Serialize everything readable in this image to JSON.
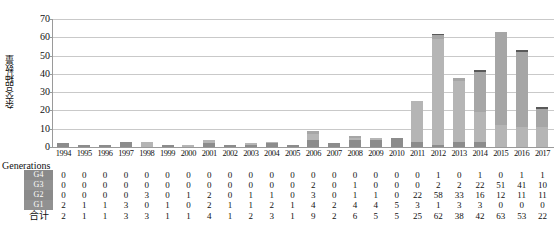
{
  "chart_data": {
    "type": "bar",
    "stacked": true,
    "title": "",
    "xlabel": "",
    "ylabel": "杂交品种数量",
    "ylim": [
      0,
      70
    ],
    "yticks": [
      0,
      10,
      20,
      30,
      40,
      50,
      60,
      70
    ],
    "grid": true,
    "legend_position": "table-below",
    "categories": [
      "1994",
      "1995",
      "1996",
      "1997",
      "1998",
      "1999",
      "2000",
      "2001",
      "2002",
      "2003",
      "2004",
      "2005",
      "2006",
      "2007",
      "2008",
      "2009",
      "2010",
      "2011",
      "2012",
      "2013",
      "2014",
      "2015",
      "2016",
      "2017"
    ],
    "series": [
      {
        "name": "G4",
        "color": "#595959",
        "values": [
          0,
          0,
          0,
          0,
          0,
          0,
          0,
          0,
          0,
          0,
          0,
          0,
          0,
          0,
          0,
          0,
          0,
          0,
          1,
          0,
          1,
          0,
          1,
          1
        ]
      },
      {
        "name": "G3",
        "color": "#a6a6a6",
        "values": [
          0,
          0,
          0,
          0,
          0,
          0,
          0,
          0,
          0,
          0,
          0,
          0,
          2,
          0,
          1,
          0,
          0,
          0,
          2,
          2,
          22,
          51,
          41,
          10
        ]
      },
      {
        "name": "G2",
        "color": "#b5b5b5",
        "values": [
          0,
          0,
          0,
          0,
          3,
          0,
          1,
          2,
          0,
          1,
          1,
          0,
          3,
          0,
          1,
          1,
          0,
          22,
          58,
          33,
          16,
          12,
          11,
          11
        ]
      },
      {
        "name": "G1",
        "color": "#8c8c8c",
        "values": [
          2,
          1,
          1,
          3,
          0,
          1,
          0,
          2,
          1,
          1,
          2,
          1,
          4,
          2,
          4,
          4,
          5,
          3,
          1,
          3,
          3,
          0,
          0,
          0
        ]
      }
    ],
    "totals": [
      2,
      1,
      1,
      3,
      3,
      1,
      1,
      4,
      1,
      2,
      3,
      1,
      9,
      2,
      6,
      5,
      5,
      25,
      62,
      38,
      42,
      63,
      53,
      22
    ]
  },
  "table": {
    "generations_header": "Generations",
    "row_labels": [
      "G4",
      "G3",
      "G2",
      "G1"
    ],
    "total_label": "合计"
  },
  "axis": {
    "y_label": "杂交品种数量"
  }
}
